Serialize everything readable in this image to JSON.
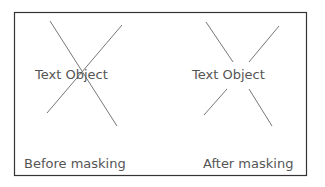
{
  "diagram": {
    "frame_color": "#333333",
    "line_color": "#777777",
    "left_panel": {
      "object_text": "Text Object",
      "caption": "Before masking"
    },
    "right_panel": {
      "object_text": "Text Object",
      "caption": "After masking"
    }
  }
}
